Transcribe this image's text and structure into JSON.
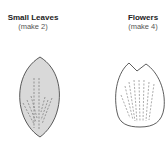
{
  "pieces": [
    {
      "title": "Small Leaves",
      "note": "(make 2)",
      "shape": "leaf",
      "fill": "#d9d9d9"
    },
    {
      "title": "Flowers",
      "note": "(make 4)",
      "shape": "petal",
      "fill": "#ffffff"
    }
  ],
  "colors": {
    "outline": "#333333",
    "dash": "#777777"
  }
}
